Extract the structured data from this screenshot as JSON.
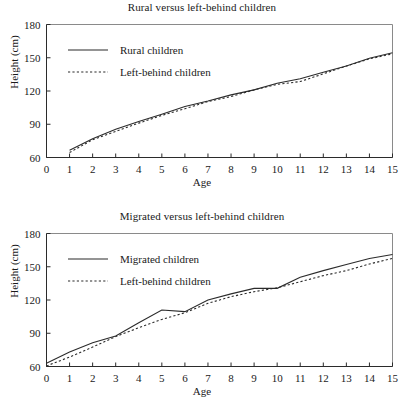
{
  "figures": [
    {
      "id": "top",
      "title": "Rural versus left-behind children",
      "xlabel": "Age",
      "ylabel": "Height (cm)",
      "legend": [
        {
          "label": "Rural children",
          "style": "solid"
        },
        {
          "label": "Left-behind children",
          "style": "dotted"
        }
      ]
    },
    {
      "id": "bottom",
      "title": "Migrated versus left-behind children",
      "xlabel": "Age",
      "ylabel": "Height (cm)",
      "legend": [
        {
          "label": "Migrated children",
          "style": "solid"
        },
        {
          "label": "Left-behind children",
          "style": "dotted"
        }
      ]
    }
  ],
  "chart_data": [
    {
      "type": "line",
      "title": "Rural versus left-behind children",
      "xlabel": "Age",
      "ylabel": "Height (cm)",
      "xlim": [
        0,
        15
      ],
      "ylim": [
        60,
        180
      ],
      "xticks": [
        0,
        1,
        2,
        3,
        4,
        5,
        6,
        7,
        8,
        9,
        10,
        11,
        12,
        13,
        14,
        15
      ],
      "yticks": [
        60,
        90,
        120,
        150,
        180
      ],
      "grid": false,
      "legend_position": "upper-left-inside",
      "series": [
        {
          "name": "Rural children",
          "style": "solid",
          "x": [
            1,
            2,
            3,
            4,
            5,
            6,
            7,
            8,
            9,
            10,
            11,
            12,
            13,
            14,
            15
          ],
          "values": [
            66.5,
            77.0,
            85.5,
            92.5,
            99.0,
            106.0,
            111.0,
            116.5,
            121.0,
            127.0,
            131.0,
            137.0,
            142.5,
            149.5,
            154.5
          ]
        },
        {
          "name": "Left-behind children",
          "style": "dotted",
          "x": [
            1,
            2,
            3,
            4,
            5,
            6,
            7,
            8,
            9,
            10,
            11,
            12,
            13,
            14,
            15
          ],
          "values": [
            64.5,
            76.0,
            83.5,
            91.0,
            98.0,
            104.0,
            110.5,
            115.0,
            121.0,
            126.0,
            128.5,
            135.5,
            142.5,
            149.0,
            153.5
          ]
        }
      ]
    },
    {
      "type": "line",
      "title": "Migrated versus left-behind children",
      "xlabel": "Age",
      "ylabel": "Height (cm)",
      "xlim": [
        0,
        15
      ],
      "ylim": [
        60,
        180
      ],
      "xticks": [
        0,
        1,
        2,
        3,
        4,
        5,
        6,
        7,
        8,
        9,
        10,
        11,
        12,
        13,
        14,
        15
      ],
      "yticks": [
        60,
        90,
        120,
        150,
        180
      ],
      "grid": false,
      "legend_position": "upper-left-inside",
      "series": [
        {
          "name": "Migrated children",
          "style": "solid",
          "x": [
            0,
            1,
            2,
            3,
            4,
            5,
            6,
            7,
            8,
            9,
            10,
            11,
            12,
            13,
            14,
            15
          ],
          "values": [
            63.0,
            73.0,
            81.5,
            87.5,
            99.5,
            111.0,
            109.5,
            120.0,
            125.5,
            130.5,
            130.5,
            140.5,
            146.5,
            152.0,
            157.5,
            161.0
          ]
        },
        {
          "name": "Left-behind children",
          "style": "dotted",
          "x": [
            0,
            1,
            2,
            3,
            4,
            5,
            6,
            7,
            8,
            9,
            10,
            11,
            12,
            13,
            14,
            15
          ],
          "values": [
            60.5,
            68.5,
            77.5,
            87.0,
            95.0,
            102.5,
            108.5,
            117.0,
            123.0,
            127.5,
            131.0,
            136.5,
            142.0,
            146.5,
            152.5,
            157.5
          ]
        }
      ]
    }
  ]
}
